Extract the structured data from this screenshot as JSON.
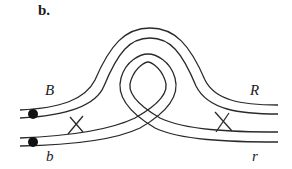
{
  "figure": {
    "panel_label": "b.",
    "labels": {
      "top_left": "B",
      "bottom_left": "b",
      "top_right": "R",
      "bottom_right": "r"
    },
    "elements": {
      "strands": [
        "outer-arch-strand",
        "inner-loop-strand"
      ],
      "markers": [
        "left-upper-dot",
        "left-lower-dot"
      ],
      "crossovers": [
        "left-crossover",
        "right-crossover"
      ]
    },
    "colors": {
      "line": "#2a2a2a",
      "dot": "#111111",
      "background": "#ffffff"
    }
  }
}
